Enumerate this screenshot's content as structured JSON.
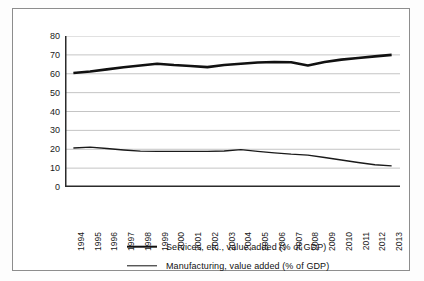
{
  "chart_data": {
    "type": "line",
    "title": "",
    "subtitle": "",
    "xlabel": "",
    "ylabel": "",
    "xlim": [
      1994,
      2013
    ],
    "ylim": [
      0,
      80
    ],
    "yticks": [
      0,
      10,
      20,
      30,
      40,
      50,
      60,
      70,
      80
    ],
    "grid": "horizontal",
    "legend_position": "bottom",
    "categories": [
      "1994",
      "1995",
      "1996",
      "1997",
      "1998",
      "1999",
      "2000",
      "2001",
      "2002",
      "2003",
      "2004",
      "2005",
      "2006",
      "2007",
      "2008",
      "2009",
      "2010",
      "2011",
      "2012",
      "2013"
    ],
    "x": [
      1994,
      1995,
      1996,
      1997,
      1998,
      1999,
      2000,
      2001,
      2002,
      2003,
      2004,
      2005,
      2006,
      2007,
      2008,
      2009,
      2010,
      2011,
      2012,
      2013
    ],
    "series": [
      {
        "name": "Services, etc., value added (% of GDP)",
        "color": "#111111",
        "line_width": 2.6,
        "values": [
          60.4,
          61.2,
          62.3,
          63.4,
          64.4,
          65.3,
          64.6,
          64.1,
          63.5,
          64.6,
          65.3,
          66.0,
          66.2,
          66.1,
          64.4,
          66.2,
          67.5,
          68.3,
          69.2,
          70.0
        ]
      },
      {
        "name": "Manufacturing, value added (% of GDP)",
        "color": "#1a1a1a",
        "line_width": 1.4,
        "values": [
          20.7,
          21.1,
          20.4,
          19.6,
          19.0,
          18.9,
          18.9,
          18.9,
          18.9,
          19.1,
          19.8,
          18.9,
          18.1,
          17.4,
          16.9,
          15.6,
          14.3,
          13.0,
          11.8,
          11.2
        ]
      }
    ]
  },
  "axis": {
    "y_tick_labels": [
      "0",
      "10",
      "20",
      "30",
      "40",
      "50",
      "60",
      "70",
      "80"
    ],
    "x_tick_labels": [
      "1994",
      "1995",
      "1996",
      "1997",
      "1998",
      "1999",
      "2000",
      "2001",
      "2002",
      "2003",
      "2004",
      "2005",
      "2006",
      "2007",
      "2008",
      "2009",
      "2010",
      "2011",
      "2012",
      "2013"
    ]
  },
  "legend": {
    "items": [
      {
        "label": "Services, etc., value added (% of GDP)",
        "style": "thick"
      },
      {
        "label": "Manufacturing, value added (% of GDP)",
        "style": "thin"
      }
    ]
  },
  "colors": {
    "frame": "#8d8d8d",
    "axis": "#2b2b2b",
    "grid": "#b5b5b5",
    "series_primary": "#111111",
    "series_secondary": "#1a1a1a",
    "background": "#ffffff"
  }
}
